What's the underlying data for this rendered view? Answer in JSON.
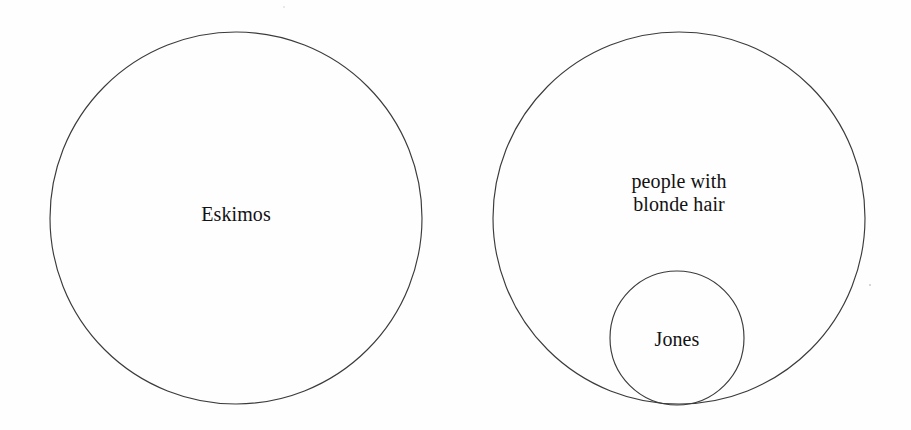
{
  "figure": {
    "type": "euler-venn-diagram",
    "background_color": "#fefefe",
    "stroke_color": "#3b3b3b",
    "text_color": "#121212",
    "width": 911,
    "height": 430
  },
  "sets": [
    {
      "id": "eskimos",
      "label": "Eskimos",
      "shape": "circle",
      "cx": 236,
      "cy": 218,
      "r": 186,
      "relation": "disjoint"
    },
    {
      "id": "blonde-hair",
      "label": "people with\nblonde hair",
      "shape": "circle",
      "cx": 679,
      "cy": 218,
      "r": 186,
      "relation": "contains-jones"
    },
    {
      "id": "jones",
      "label": "Jones",
      "shape": "circle",
      "cx": 677,
      "cy": 338,
      "r": 67,
      "relation": "subset-of-blonde-hair"
    }
  ],
  "marks": [
    {
      "id": "speck-right",
      "x": 869,
      "y": 284
    },
    {
      "id": "speck-top",
      "x": 283,
      "y": 6
    }
  ]
}
